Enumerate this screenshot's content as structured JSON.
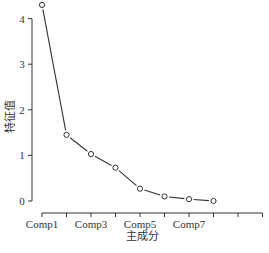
{
  "chart_data": {
    "type": "line",
    "title": "",
    "xlabel": "主成分",
    "ylabel": "特征值",
    "categories": [
      "Comp1",
      "Comp2",
      "Comp3",
      "Comp4",
      "Comp5",
      "Comp6",
      "Comp7",
      "Comp8"
    ],
    "x_tick_labels_shown": [
      "Comp1",
      "Comp3",
      "Comp5",
      "Comp7"
    ],
    "x_tick_count": 10,
    "values": [
      4.3,
      1.45,
      1.03,
      0.73,
      0.27,
      0.1,
      0.04,
      0.0
    ],
    "ylim": [
      0,
      4.3
    ],
    "y_ticks": [
      0,
      1,
      2,
      3,
      4
    ],
    "grid": false,
    "marker": "open-circle",
    "line_color": "#333333"
  },
  "caption": "图 ... 主成分碎石图"
}
